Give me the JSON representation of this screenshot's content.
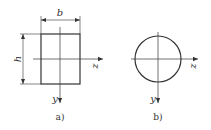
{
  "figure": {
    "panel_a": {
      "shape": "rectangle",
      "width_label": "b",
      "height_label": "h",
      "axis_horizontal_label": "z",
      "axis_vertical_label": "y",
      "caption": "a)"
    },
    "panel_b": {
      "shape": "circle",
      "axis_horizontal_label": "z",
      "axis_vertical_label": "y",
      "caption": "b)"
    },
    "colors": {
      "stroke": "#333333",
      "background": "#ffffff"
    }
  }
}
